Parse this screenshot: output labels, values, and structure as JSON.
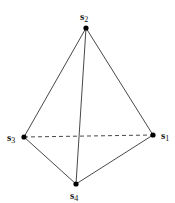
{
  "diagram": {
    "type": "tetrahedron",
    "vertices": [
      {
        "id": "s1",
        "label": "s",
        "subscript": "1",
        "x": 153,
        "y": 135,
        "label_x": 161,
        "label_y": 139
      },
      {
        "id": "s2",
        "label": "s",
        "subscript": "2",
        "x": 86,
        "y": 28,
        "label_x": 80,
        "label_y": 20
      },
      {
        "id": "s3",
        "label": "s",
        "subscript": "3",
        "x": 24,
        "y": 137,
        "label_x": 7,
        "label_y": 141
      },
      {
        "id": "s4",
        "label": "s",
        "subscript": "4",
        "x": 76,
        "y": 184,
        "label_x": 70,
        "label_y": 199
      }
    ],
    "edges": [
      {
        "from": "s2",
        "to": "s3",
        "style": "solid"
      },
      {
        "from": "s2",
        "to": "s1",
        "style": "solid"
      },
      {
        "from": "s2",
        "to": "s4",
        "style": "solid"
      },
      {
        "from": "s3",
        "to": "s4",
        "style": "solid"
      },
      {
        "from": "s4",
        "to": "s1",
        "style": "solid"
      },
      {
        "from": "s3",
        "to": "s1",
        "style": "dashed"
      }
    ],
    "colors": {
      "line": "#333333",
      "vertex": "#000000",
      "background": "#ffffff"
    }
  }
}
